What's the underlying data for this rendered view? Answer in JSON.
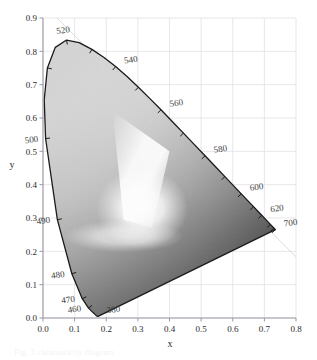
{
  "figure": {
    "kind": "cie-1931-chromaticity-diagram",
    "rendering": "grayscale",
    "background_color": "#ffffff",
    "grid_color": "#dcdce4",
    "axis_color": "#9a9aa2",
    "outline_color": "#1a1a1a",
    "guide_line_color": "#d9d9e0",
    "caption_partial": "Fig. 1  chromaticity diagram"
  },
  "axes": {
    "x": {
      "label": "x",
      "min": 0.0,
      "max": 0.8,
      "step": 0.1,
      "ticks": [
        "0.0",
        "0.1",
        "0.2",
        "0.3",
        "0.4",
        "0.5",
        "0.6",
        "0.7",
        "0.8"
      ]
    },
    "y": {
      "label": "y",
      "min": 0.0,
      "max": 0.9,
      "step": 0.1,
      "ticks": [
        "0.0",
        "0.1",
        "0.2",
        "0.3",
        "0.4",
        "0.5",
        "0.6",
        "0.7",
        "0.8",
        "0.9"
      ]
    }
  },
  "chart_data": {
    "type": "scatter",
    "title": "",
    "subtitle": "",
    "xlabel": "x",
    "ylabel": "y",
    "xlim": [
      0.0,
      0.8
    ],
    "ylim": [
      0.0,
      0.9
    ],
    "grid": true,
    "legend": "none",
    "annotations": [
      {
        "label": "520",
        "x": 0.0743,
        "y": 0.8338,
        "anchor": "above-left"
      },
      {
        "label": "540",
        "x": 0.2296,
        "y": 0.7543,
        "anchor": "right"
      },
      {
        "label": "560",
        "x": 0.3731,
        "y": 0.6245,
        "anchor": "right"
      },
      {
        "label": "580",
        "x": 0.5125,
        "y": 0.4866,
        "anchor": "right"
      },
      {
        "label": "600",
        "x": 0.627,
        "y": 0.3725,
        "anchor": "right"
      },
      {
        "label": "620",
        "x": 0.6915,
        "y": 0.3083,
        "anchor": "right"
      },
      {
        "label": "700",
        "x": 0.7347,
        "y": 0.2653,
        "anchor": "right"
      },
      {
        "label": "500",
        "x": 0.0082,
        "y": 0.5384,
        "anchor": "left"
      },
      {
        "label": "490",
        "x": 0.0454,
        "y": 0.295,
        "anchor": "left"
      },
      {
        "label": "480",
        "x": 0.0913,
        "y": 0.1327,
        "anchor": "left"
      },
      {
        "label": "470",
        "x": 0.1241,
        "y": 0.0578,
        "anchor": "left"
      },
      {
        "label": "460",
        "x": 0.144,
        "y": 0.0297,
        "anchor": "left"
      },
      {
        "label": "380",
        "x": 0.1741,
        "y": 0.005,
        "anchor": "right"
      }
    ],
    "spectral_locus": [
      {
        "nm": 380,
        "x": 0.1741,
        "y": 0.005
      },
      {
        "nm": 390,
        "x": 0.1738,
        "y": 0.0049
      },
      {
        "nm": 400,
        "x": 0.1733,
        "y": 0.0048
      },
      {
        "nm": 410,
        "x": 0.1726,
        "y": 0.0048
      },
      {
        "nm": 420,
        "x": 0.1714,
        "y": 0.0051
      },
      {
        "nm": 430,
        "x": 0.1689,
        "y": 0.0069
      },
      {
        "nm": 440,
        "x": 0.1644,
        "y": 0.0109
      },
      {
        "nm": 450,
        "x": 0.1566,
        "y": 0.0177
      },
      {
        "nm": 460,
        "x": 0.144,
        "y": 0.0297
      },
      {
        "nm": 470,
        "x": 0.1241,
        "y": 0.0578
      },
      {
        "nm": 480,
        "x": 0.0913,
        "y": 0.1327
      },
      {
        "nm": 490,
        "x": 0.0454,
        "y": 0.295
      },
      {
        "nm": 500,
        "x": 0.0082,
        "y": 0.5384
      },
      {
        "nm": 505,
        "x": 0.0039,
        "y": 0.6548
      },
      {
        "nm": 510,
        "x": 0.0139,
        "y": 0.7502
      },
      {
        "nm": 515,
        "x": 0.0389,
        "y": 0.812
      },
      {
        "nm": 520,
        "x": 0.0743,
        "y": 0.8338
      },
      {
        "nm": 525,
        "x": 0.1142,
        "y": 0.8262
      },
      {
        "nm": 530,
        "x": 0.1547,
        "y": 0.8059
      },
      {
        "nm": 535,
        "x": 0.1929,
        "y": 0.7816
      },
      {
        "nm": 540,
        "x": 0.2296,
        "y": 0.7543
      },
      {
        "nm": 545,
        "x": 0.2658,
        "y": 0.7243
      },
      {
        "nm": 550,
        "x": 0.3016,
        "y": 0.6923
      },
      {
        "nm": 555,
        "x": 0.3373,
        "y": 0.6589
      },
      {
        "nm": 560,
        "x": 0.3731,
        "y": 0.6245
      },
      {
        "nm": 565,
        "x": 0.4087,
        "y": 0.5896
      },
      {
        "nm": 570,
        "x": 0.4441,
        "y": 0.5547
      },
      {
        "nm": 575,
        "x": 0.4788,
        "y": 0.5202
      },
      {
        "nm": 580,
        "x": 0.5125,
        "y": 0.4866
      },
      {
        "nm": 585,
        "x": 0.5448,
        "y": 0.4544
      },
      {
        "nm": 590,
        "x": 0.5752,
        "y": 0.4242
      },
      {
        "nm": 595,
        "x": 0.6029,
        "y": 0.3965
      },
      {
        "nm": 600,
        "x": 0.627,
        "y": 0.3725
      },
      {
        "nm": 605,
        "x": 0.6482,
        "y": 0.3514
      },
      {
        "nm": 610,
        "x": 0.6658,
        "y": 0.334
      },
      {
        "nm": 615,
        "x": 0.6801,
        "y": 0.3197
      },
      {
        "nm": 620,
        "x": 0.6915,
        "y": 0.3083
      },
      {
        "nm": 630,
        "x": 0.7079,
        "y": 0.292
      },
      {
        "nm": 640,
        "x": 0.719,
        "y": 0.2809
      },
      {
        "nm": 650,
        "x": 0.726,
        "y": 0.274
      },
      {
        "nm": 660,
        "x": 0.73,
        "y": 0.27
      },
      {
        "nm": 680,
        "x": 0.7334,
        "y": 0.2666
      },
      {
        "nm": 700,
        "x": 0.7347,
        "y": 0.2653
      }
    ],
    "tick_wavelengths": [
      460,
      470,
      480,
      490,
      500,
      510,
      520,
      530,
      540,
      550,
      560,
      570,
      580,
      590,
      600,
      610,
      620,
      640,
      660,
      700
    ],
    "purple_line": {
      "from_nm": 700,
      "to_nm": 380
    },
    "guide_line": {
      "from": [
        0.0443,
        0.9
      ],
      "to": [
        0.8,
        0.1834
      ]
    },
    "white_point_ridge": {
      "x": 0.313,
      "y": 0.329,
      "note": "bright luminance ridge near neutral point"
    }
  }
}
